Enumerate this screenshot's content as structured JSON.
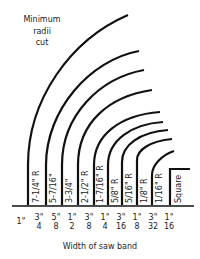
{
  "title": {
    "lines": [
      "Minimum",
      "radii",
      "cut"
    ]
  },
  "x_axis_label": "Width of saw band",
  "widths": [
    {
      "num": "1\"",
      "den": "",
      "whole": true
    },
    {
      "num": "3\"",
      "den": "4"
    },
    {
      "num": "5\"",
      "den": "8"
    },
    {
      "num": "1\"",
      "den": "2"
    },
    {
      "num": "3\"",
      "den": "8"
    },
    {
      "num": "1\"",
      "den": "4"
    },
    {
      "num": "3\"",
      "den": "16"
    },
    {
      "num": "1\"",
      "den": "8"
    },
    {
      "num": "3\"",
      "den": "32"
    },
    {
      "num": "1\"",
      "den": "16"
    }
  ],
  "radii_labels": [
    "7-1/4\" R",
    "5-7/16\"",
    "3-3/4\"",
    "2-1/2\" R",
    "1-7/16\" R",
    "5/8\" R",
    "5/16\" R",
    "1/8\" R",
    "1/16\" R",
    "Square"
  ],
  "colors": {
    "line": "#111111",
    "background": "#ffffff"
  }
}
